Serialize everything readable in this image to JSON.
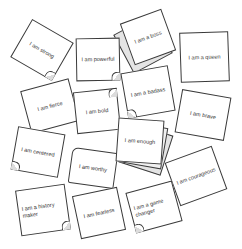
{
  "notes": [
    {
      "id": "strong",
      "text": "I am strong"
    },
    {
      "id": "powerful",
      "text": "I am powerful"
    },
    {
      "id": "boss",
      "text": "I am a boss"
    },
    {
      "id": "queen",
      "text": "I am a queen"
    },
    {
      "id": "fierce",
      "text": "I am fierce"
    },
    {
      "id": "bold",
      "text": "I am bold"
    },
    {
      "id": "badass",
      "text": "I am a badass"
    },
    {
      "id": "brave",
      "text": "I am brave"
    },
    {
      "id": "centered",
      "text": "I am centered"
    },
    {
      "id": "worthy",
      "text": "I am worthy"
    },
    {
      "id": "enough",
      "text": "I am enough"
    },
    {
      "id": "courageous",
      "text": "I am courageous"
    },
    {
      "id": "history_maker",
      "text": "I am a history maker"
    },
    {
      "id": "fearless",
      "text": "I am fearless"
    },
    {
      "id": "game_changer",
      "text": "I am a game changer"
    }
  ],
  "colors": {
    "paper": "#ffffff",
    "outline": "#3a3a3a",
    "shadow_sheet": "#e4e4e4"
  }
}
